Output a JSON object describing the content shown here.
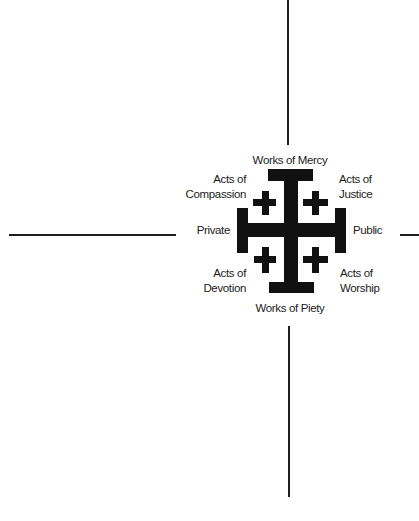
{
  "diagram": {
    "axes": {
      "top": "Works of Mercy",
      "bottom": "Works of Piety",
      "left": "Private",
      "right": "Public"
    },
    "quadrants": {
      "upper_left": {
        "line1": "Acts of",
        "line2": "Compassion"
      },
      "upper_right": {
        "line1": "Acts of",
        "line2": "Justice"
      },
      "lower_left": {
        "line1": "Acts of",
        "line2": "Devotion"
      },
      "lower_right": {
        "line1": "Acts of",
        "line2": "Worship"
      }
    },
    "center_symbol": "jerusalem-cross",
    "colors": {
      "ink": "#111111",
      "line": "#1e1e1e",
      "background": "#ffffff"
    }
  }
}
